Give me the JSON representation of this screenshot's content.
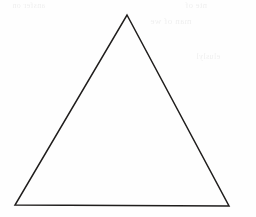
{
  "figure": {
    "name": "triangle-line-drawing",
    "description": "Hand-drawn acute triangle outline on white scanned paper",
    "background_color": "#fefefe",
    "stroke_color": "#1f1d1c",
    "stroke_width": "1.5",
    "canvas": {
      "width": 256,
      "height": 217
    },
    "vertices": {
      "apex_label": "apex",
      "apex_x": 127,
      "apex_y": 15,
      "bottom_left_label": "bottom-left",
      "bottom_left_x": 15,
      "bottom_left_y": 205,
      "bottom_right_label": "bottom-right",
      "bottom_right_x": 229,
      "bottom_right_y": 206
    },
    "points_path": "127,15 229,206 15,205"
  },
  "bleed_through": {
    "note": "faint mirrored show-through text from reverse of page, illegible",
    "color": "#d9d9d9",
    "lines": [
      "ansfer on",
      "nte of",
      "man of we",
      "eluslyl"
    ]
  }
}
